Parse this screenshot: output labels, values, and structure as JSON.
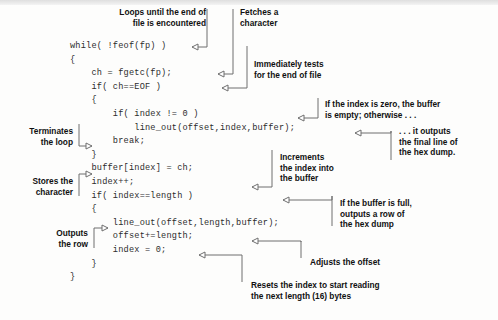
{
  "figure": {
    "code_lines": [
      "while( !feof(fp) )",
      "{",
      "    ch = fgetc(fp);",
      "    if( ch==EOF )",
      "    {",
      "        if( index != 0 )",
      "            line_out(offset,index,buffer);",
      "        break;",
      "    }",
      "    buffer[index] = ch;",
      "    index++;",
      "    if( index==length )",
      "    {",
      "        line_out(offset,length,buffer);",
      "        offset+=length;",
      "        index = 0;",
      "    }",
      "}"
    ],
    "code_block": "while( !feof(fp) )\n{\n    ch = fgetc(fp);\n    if( ch==EOF )\n    {\n        if( index != 0 )\n            line_out(offset,index,buffer);\n        break;\n    }\n    buffer[index] = ch;\n    index++;\n    if( index==length )\n    {\n        line_out(offset,length,buffer);\n        offset+=length;\n        index = 0;\n    }\n}",
    "annotations": [
      {
        "id": "loops-until-eof",
        "text": "Loops until the end of\nfile is encountered"
      },
      {
        "id": "fetches-a-character",
        "text": "Fetches a\ncharacter"
      },
      {
        "id": "immediately-tests-eof",
        "text": "Immediately tests\nfor the end of file"
      },
      {
        "id": "index-is-zero",
        "text": "If the index is zero, the buffer\nis empty; otherwise . . ."
      },
      {
        "id": "terminates-the-loop",
        "text": "Terminates\nthe loop"
      },
      {
        "id": "it-outputs-final-line",
        "text": ". . . it outputs\nthe final line of\nthe hex dump."
      },
      {
        "id": "increments-the-index",
        "text": "Increments\nthe index into\nthe buffer"
      },
      {
        "id": "stores-the-character",
        "text": "Stores the\ncharacter"
      },
      {
        "id": "buffer-is-full",
        "text": "If the buffer is full,\noutputs a row of\nthe hex dump"
      },
      {
        "id": "outputs-the-row",
        "text": "Outputs\nthe row"
      },
      {
        "id": "adjusts-the-offset",
        "text": "Adjusts the offset"
      },
      {
        "id": "resets-the-index",
        "text": "Resets the index to start reading\nthe next length (16) bytes"
      }
    ],
    "colors": {
      "page_background": "#fdfdfc",
      "code_text": "#2c2c2c",
      "label_text": "#111111",
      "leader_line": "#6f6f6f"
    }
  }
}
